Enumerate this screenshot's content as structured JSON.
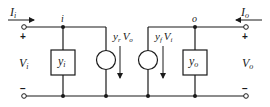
{
  "diagram": {
    "input_port": {
      "current_label": "I",
      "current_sub": "i",
      "voltage_label": "V",
      "voltage_sub": "i",
      "plus": "+",
      "minus": "−",
      "node_label": "i"
    },
    "output_port": {
      "current_label": "I",
      "current_sub": "o",
      "voltage_label": "V",
      "voltage_sub": "o",
      "plus": "+",
      "minus": "−",
      "node_label": "o"
    },
    "elements": {
      "input_admittance": {
        "label": "y",
        "sub": "i"
      },
      "output_admittance": {
        "label": "y",
        "sub": "o"
      },
      "reverse_source": {
        "label": "y",
        "sub": "r",
        "ctrl": "V",
        "ctrl_sub": "o"
      },
      "forward_source": {
        "label": "y",
        "sub": "f",
        "ctrl": "V",
        "ctrl_sub": "i"
      }
    },
    "colors": {
      "stroke": "#1a1a1a",
      "background": "#ffffff"
    }
  }
}
